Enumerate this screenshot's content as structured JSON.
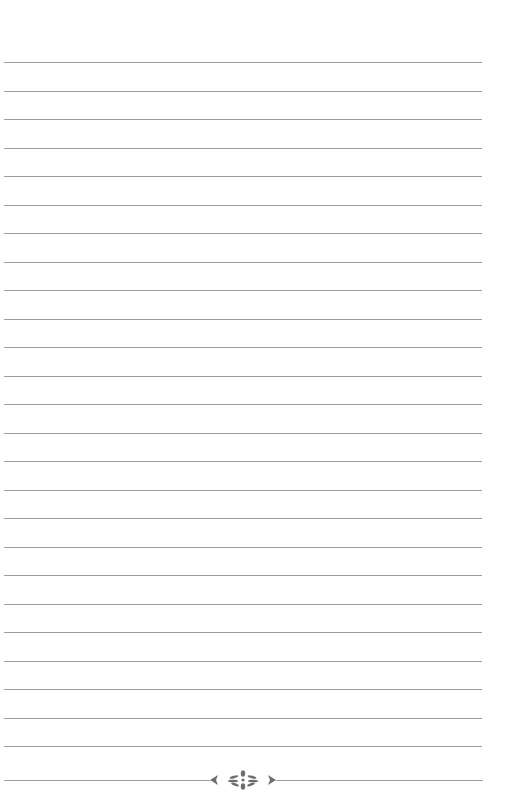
{
  "page": {
    "type": "lined-notebook-page",
    "background_color": "#ffffff",
    "rule_color": "#8c8c8c",
    "ornament_color": "#6e6e6e",
    "rule_count": 25,
    "first_rule_y": 62,
    "rule_spacing": 28.5,
    "footer": {
      "ornament": "floral-divider-icon",
      "rule_y": 780
    }
  }
}
